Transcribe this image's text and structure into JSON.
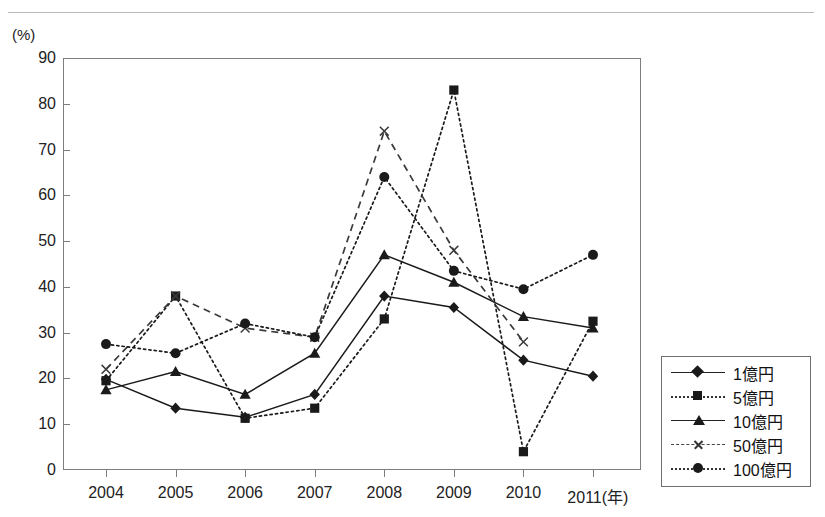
{
  "page": {
    "cut_off_top_text": "",
    "axis_unit_label": "(%)"
  },
  "chart_data": {
    "type": "line",
    "title": "",
    "xlabel": "(年)",
    "ylabel": "(%)",
    "categories": [
      "2004",
      "2005",
      "2006",
      "2007",
      "2008",
      "2009",
      "2010",
      "2011"
    ],
    "x_axis_suffix": "(年)",
    "ylim": [
      0,
      90
    ],
    "ytick_labels": [
      "0",
      "10",
      "20",
      "30",
      "40",
      "50",
      "60",
      "70",
      "80",
      "90"
    ],
    "ytick_values": [
      0,
      10,
      20,
      30,
      40,
      50,
      60,
      70,
      80,
      90
    ],
    "grid": false,
    "legend_position": "right-outside",
    "series": [
      {
        "name": "1億円",
        "marker": "diamond",
        "line_style": "solid",
        "color": "#1a1a1a",
        "values": [
          19.8,
          13.5,
          11.5,
          16.5,
          38.0,
          35.5,
          24.0,
          20.5
        ]
      },
      {
        "name": "5億円",
        "marker": "square",
        "line_style": "dotted",
        "color": "#1a1a1a",
        "values": [
          19.5,
          38.0,
          11.3,
          13.5,
          33.0,
          83.0,
          4.0,
          32.5
        ]
      },
      {
        "name": "10億円",
        "marker": "triangle",
        "line_style": "solid",
        "color": "#1a1a1a",
        "values": [
          17.5,
          21.5,
          16.5,
          25.5,
          47.0,
          41.0,
          33.5,
          31.0
        ]
      },
      {
        "name": "50億円",
        "marker": "x",
        "line_style": "dashed",
        "color": "#3a3a3a",
        "values": [
          22.0,
          38.0,
          31.0,
          29.0,
          74.0,
          48.0,
          28.0,
          null
        ]
      },
      {
        "name": "100億円",
        "marker": "circle",
        "line_style": "dotted",
        "color": "#1a1a1a",
        "values": [
          27.5,
          25.5,
          32.0,
          29.0,
          64.0,
          43.5,
          39.5,
          47.0
        ]
      }
    ]
  },
  "legend": {
    "items": [
      {
        "label": "1億円"
      },
      {
        "label": "5億円"
      },
      {
        "label": "10億円"
      },
      {
        "label": "50億円"
      },
      {
        "label": "100億円"
      }
    ]
  }
}
